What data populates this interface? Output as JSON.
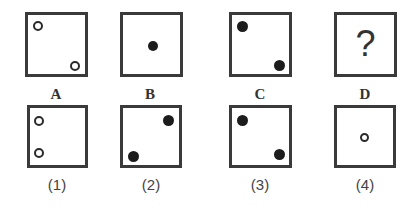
{
  "puzzle": {
    "question_figures": [
      {
        "label": "A",
        "dots": [
          {
            "type": "hollow",
            "pos": "top-left"
          },
          {
            "type": "hollow",
            "pos": "bottom-right"
          }
        ]
      },
      {
        "label": "B",
        "dots": [
          {
            "type": "filled",
            "pos": "center"
          }
        ]
      },
      {
        "label": "C",
        "dots": [
          {
            "type": "filled",
            "pos": "top-left"
          },
          {
            "type": "filled",
            "pos": "bottom-right"
          }
        ]
      },
      {
        "label": "D",
        "content": "?"
      }
    ],
    "answer_options": [
      {
        "label": "(1)",
        "dots": [
          {
            "type": "hollow",
            "pos": "left-upper"
          },
          {
            "type": "hollow",
            "pos": "left-lower"
          }
        ]
      },
      {
        "label": "(2)",
        "dots": [
          {
            "type": "filled",
            "pos": "top-right"
          },
          {
            "type": "filled",
            "pos": "bottom-left"
          }
        ]
      },
      {
        "label": "(3)",
        "dots": [
          {
            "type": "filled",
            "pos": "top-left"
          },
          {
            "type": "filled",
            "pos": "bottom-right"
          }
        ]
      },
      {
        "label": "(4)",
        "dots": [
          {
            "type": "hollow",
            "pos": "center"
          }
        ]
      }
    ]
  }
}
